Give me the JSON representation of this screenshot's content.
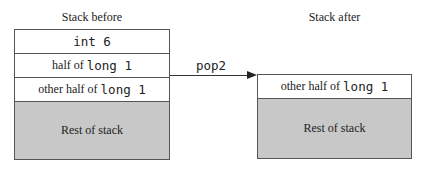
{
  "before": {
    "title": "Stack before",
    "rows": [
      {
        "prefix": "",
        "mono": "int 6"
      },
      {
        "prefix": "half of ",
        "mono": "long 1"
      },
      {
        "prefix": "other half of ",
        "mono": "long 1"
      }
    ],
    "rest": "Rest of stack"
  },
  "operation": {
    "label": "pop2"
  },
  "after": {
    "title": "Stack after",
    "rows": [
      {
        "prefix": "other half of ",
        "mono": "long 1"
      }
    ],
    "rest": "Rest of stack"
  },
  "colors": {
    "rest_fill": "#c8c8c8",
    "border": "#555555"
  }
}
